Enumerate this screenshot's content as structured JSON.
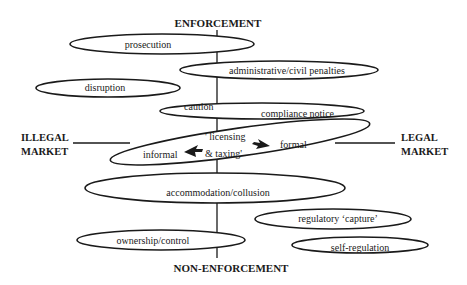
{
  "axes": {
    "top": "ENFORCEMENT",
    "bottom": "NON-ENFORCEMENT",
    "left_line1": "ILLEGAL",
    "left_line2": "MARKET",
    "right_line1": "LEGAL",
    "right_line2": "MARKET"
  },
  "nodes": {
    "prosecution": "prosecution",
    "administrative": "administrative/civil penalties",
    "disruption": "disruption",
    "caution": "caution",
    "compliance": "compliance notice",
    "central_line1": "' licensing",
    "central_line2": "& taxing'",
    "informal": "informal",
    "formal": "formal",
    "accommodation": "accommodation/collusion",
    "regulatory_capture": "regulatory ‘capture’",
    "ownership": "ownership/control",
    "self_regulation": "self-regulation"
  },
  "colors": {
    "ink": "#1a1a1a",
    "background": "#ffffff"
  }
}
